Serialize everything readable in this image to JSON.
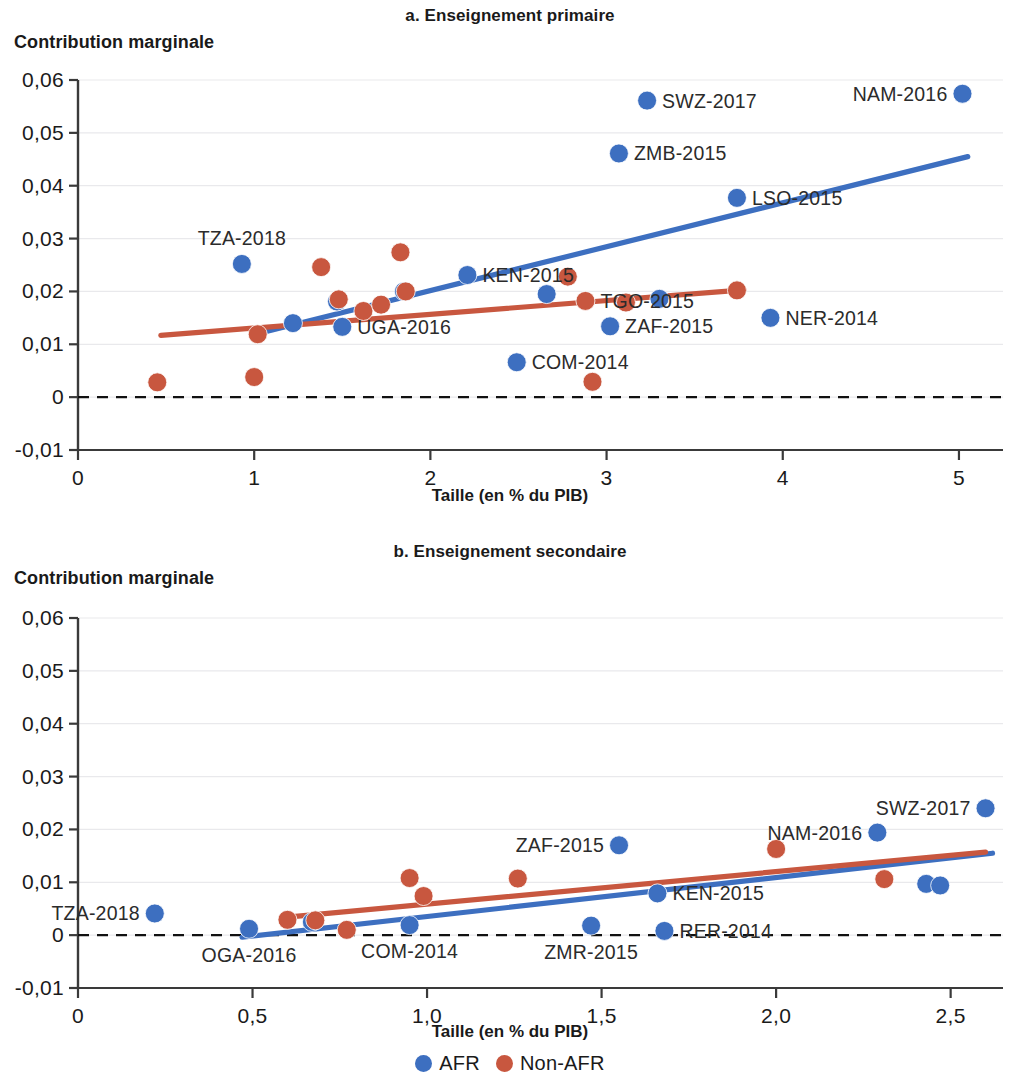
{
  "colors": {
    "afr": "#3d6fc0",
    "non_afr": "#c8573f",
    "grid": "#e9e9ec",
    "axis": "#3a3a3a",
    "text": "#1a1a1a"
  },
  "legend": {
    "position": "bottom-center",
    "items": [
      {
        "label": "AFR",
        "color": "#3d6fc0"
      },
      {
        "label": "Non-AFR",
        "color": "#c8573f"
      }
    ]
  },
  "chart_data": [
    {
      "id": "a",
      "type": "scatter",
      "title": "a. Enseignement primaire",
      "ylabel": "Contribution marginale",
      "xlabel": "Taille (en % du PIB)",
      "xlim": [
        0,
        5.25
      ],
      "ylim": [
        -0.01,
        0.06
      ],
      "xticks": [
        0,
        1,
        2,
        3,
        4,
        5
      ],
      "xticklabels": [
        "0",
        "1",
        "2",
        "3",
        "4",
        "5"
      ],
      "yticks": [
        -0.01,
        0,
        0.01,
        0.02,
        0.03,
        0.04,
        0.05,
        0.06
      ],
      "yticklabels": [
        "-0,01",
        "0",
        "0,01",
        "0,02",
        "0,03",
        "0,04",
        "0,05",
        "0,06"
      ],
      "grid": true,
      "zero_line": true,
      "series": [
        {
          "name": "AFR",
          "color": "#3d6fc0",
          "points": [
            {
              "x": 0.93,
              "y": 0.0252,
              "label": "TZA-2018",
              "label_pos": "above"
            },
            {
              "x": 1.22,
              "y": 0.014,
              "label": "",
              "label_pos": ""
            },
            {
              "x": 1.47,
              "y": 0.0181,
              "label": "",
              "label_pos": ""
            },
            {
              "x": 1.5,
              "y": 0.0133,
              "label": "UGA-2016",
              "label_pos": "right"
            },
            {
              "x": 1.85,
              "y": 0.02,
              "label": "",
              "label_pos": ""
            },
            {
              "x": 2.21,
              "y": 0.0231,
              "label": "KEN-2015",
              "label_pos": "right"
            },
            {
              "x": 2.49,
              "y": 0.0066,
              "label": "COM-2014",
              "label_pos": "right"
            },
            {
              "x": 2.66,
              "y": 0.0195,
              "label": "",
              "label_pos": ""
            },
            {
              "x": 3.02,
              "y": 0.0134,
              "label": "ZAF-2015",
              "label_pos": "right"
            },
            {
              "x": 3.07,
              "y": 0.0461,
              "label": "ZMB-2015",
              "label_pos": "right"
            },
            {
              "x": 3.23,
              "y": 0.0561,
              "label": "SWZ-2017",
              "label_pos": "right"
            },
            {
              "x": 3.3,
              "y": 0.0186,
              "label": "",
              "label_pos": ""
            },
            {
              "x": 3.74,
              "y": 0.0377,
              "label": "LSO-2015",
              "label_pos": "right"
            },
            {
              "x": 3.93,
              "y": 0.015,
              "label": "NER-2014",
              "label_pos": "right"
            },
            {
              "x": 5.02,
              "y": 0.0574,
              "label": "NAM-2016",
              "label_pos": "left"
            }
          ]
        },
        {
          "name": "Non-AFR",
          "color": "#c8573f",
          "points": [
            {
              "x": 0.45,
              "y": 0.0028,
              "label": "",
              "label_pos": ""
            },
            {
              "x": 1.0,
              "y": 0.0038,
              "label": "",
              "label_pos": ""
            },
            {
              "x": 1.02,
              "y": 0.0119,
              "label": "",
              "label_pos": ""
            },
            {
              "x": 1.38,
              "y": 0.0246,
              "label": "",
              "label_pos": ""
            },
            {
              "x": 1.48,
              "y": 0.0185,
              "label": "",
              "label_pos": ""
            },
            {
              "x": 1.62,
              "y": 0.0163,
              "label": "",
              "label_pos": ""
            },
            {
              "x": 1.72,
              "y": 0.0175,
              "label": "",
              "label_pos": ""
            },
            {
              "x": 1.83,
              "y": 0.0274,
              "label": "",
              "label_pos": ""
            },
            {
              "x": 1.86,
              "y": 0.02,
              "label": "",
              "label_pos": ""
            },
            {
              "x": 2.78,
              "y": 0.0228,
              "label": "",
              "label_pos": ""
            },
            {
              "x": 2.88,
              "y": 0.0182,
              "label": "TGO-2015",
              "label_pos": "right"
            },
            {
              "x": 2.92,
              "y": 0.0029,
              "label": "",
              "label_pos": ""
            },
            {
              "x": 3.11,
              "y": 0.0179,
              "label": "",
              "label_pos": ""
            },
            {
              "x": 3.74,
              "y": 0.0202,
              "label": "",
              "label_pos": ""
            }
          ]
        }
      ],
      "trendlines": [
        {
          "name": "AFR",
          "color": "#3d6fc0",
          "x0": 1.08,
          "y0": 0.0125,
          "x1": 5.05,
          "y1": 0.0455
        },
        {
          "name": "Non-AFR",
          "color": "#c8573f",
          "x0": 0.47,
          "y0": 0.0117,
          "x1": 3.78,
          "y1": 0.0203
        }
      ]
    },
    {
      "id": "b",
      "type": "scatter",
      "title": "b. Enseignement secondaire",
      "ylabel": "Contribution marginale",
      "xlabel": "Taille (en % du PIB)",
      "xlim": [
        0,
        2.65
      ],
      "ylim": [
        -0.01,
        0.06
      ],
      "xticks": [
        0,
        0.5,
        1.0,
        1.5,
        2.0,
        2.5
      ],
      "xticklabels": [
        "0",
        "0,5",
        "1,0",
        "1,5",
        "2,0",
        "2,5"
      ],
      "yticks": [
        -0.01,
        0,
        0.01,
        0.02,
        0.03,
        0.04,
        0.05,
        0.06
      ],
      "yticklabels": [
        "-0,01",
        "0",
        "0,01",
        "0,02",
        "0,03",
        "0,04",
        "0,05",
        "0,06"
      ],
      "grid": true,
      "zero_line": true,
      "series": [
        {
          "name": "AFR",
          "color": "#3d6fc0",
          "points": [
            {
              "x": 0.22,
              "y": 0.0041,
              "label": "TZA-2018",
              "label_pos": "left"
            },
            {
              "x": 0.49,
              "y": 0.0012,
              "label": "OGA-2016",
              "label_pos": "below"
            },
            {
              "x": 0.67,
              "y": 0.0025,
              "label": "",
              "label_pos": ""
            },
            {
              "x": 0.95,
              "y": 0.0019,
              "label": "COM-2014",
              "label_pos": "below"
            },
            {
              "x": 1.47,
              "y": 0.0018,
              "label": "ZMR-2015",
              "label_pos": "below"
            },
            {
              "x": 1.55,
              "y": 0.017,
              "label": "ZAF-2015",
              "label_pos": "left"
            },
            {
              "x": 1.66,
              "y": 0.0079,
              "label": "KEN-2015",
              "label_pos": "right"
            },
            {
              "x": 1.68,
              "y": 0.0008,
              "label": "RER-2014",
              "label_pos": "right"
            },
            {
              "x": 2.29,
              "y": 0.0194,
              "label": "NAM-2016",
              "label_pos": "left"
            },
            {
              "x": 2.43,
              "y": 0.0097,
              "label": "",
              "label_pos": ""
            },
            {
              "x": 2.47,
              "y": 0.0094,
              "label": "",
              "label_pos": ""
            },
            {
              "x": 2.6,
              "y": 0.024,
              "label": "SWZ-2017",
              "label_pos": "left"
            }
          ]
        },
        {
          "name": "Non-AFR",
          "color": "#c8573f",
          "points": [
            {
              "x": 0.6,
              "y": 0.0029,
              "label": "",
              "label_pos": ""
            },
            {
              "x": 0.68,
              "y": 0.0028,
              "label": "",
              "label_pos": ""
            },
            {
              "x": 0.77,
              "y": 0.001,
              "label": "",
              "label_pos": ""
            },
            {
              "x": 0.95,
              "y": 0.0108,
              "label": "",
              "label_pos": ""
            },
            {
              "x": 0.99,
              "y": 0.0074,
              "label": "",
              "label_pos": ""
            },
            {
              "x": 1.26,
              "y": 0.0107,
              "label": "",
              "label_pos": ""
            },
            {
              "x": 2.0,
              "y": 0.0163,
              "label": "",
              "label_pos": ""
            },
            {
              "x": 2.31,
              "y": 0.0106,
              "label": "",
              "label_pos": ""
            }
          ]
        }
      ],
      "trendlines": [
        {
          "name": "AFR",
          "color": "#3d6fc0",
          "x0": 0.47,
          "y0": -0.0004,
          "x1": 2.62,
          "y1": 0.0155
        },
        {
          "name": "Non-AFR",
          "color": "#c8573f",
          "x0": 0.6,
          "y0": 0.0034,
          "x1": 2.6,
          "y1": 0.0157
        }
      ]
    }
  ]
}
